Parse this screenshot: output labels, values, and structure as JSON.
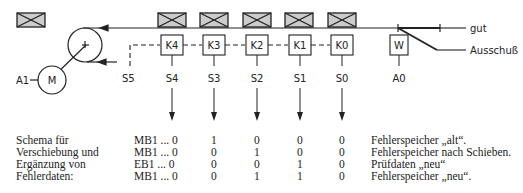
{
  "diagram": {
    "motor": {
      "label": "M",
      "output": "A1"
    },
    "registers": [
      {
        "id": "K4",
        "sensor": "S4"
      },
      {
        "id": "K3",
        "sensor": "S3"
      },
      {
        "id": "K2",
        "sensor": "S2"
      },
      {
        "id": "K1",
        "sensor": "S1"
      },
      {
        "id": "K0",
        "sensor": "S0"
      }
    ],
    "start_sensor": "S5",
    "switch": {
      "label": "W",
      "output": "A0"
    },
    "outputs": {
      "good": "gut",
      "reject": "Ausschuß"
    }
  },
  "table": {
    "caption_lines": [
      "Schema für",
      "Verschiebung und",
      "Ergänzung von",
      "Fehlerdaten:"
    ],
    "rows": [
      {
        "ref": "MB1 ... 0",
        "bits": [
          "1",
          "0",
          "0",
          "0"
        ],
        "note": "Fehlerspeicher „alt“."
      },
      {
        "ref": "MB1 ... 0",
        "bits": [
          "0",
          "1",
          "0",
          "0"
        ],
        "note": "Fehlerspeicher nach Schieben."
      },
      {
        "ref": "EB1 ... 0",
        "bits": [
          "0",
          "0",
          "1",
          "0"
        ],
        "note": "Prüfdaten „neu“"
      },
      {
        "ref": "MB1 ... 0",
        "bits": [
          "0",
          "1",
          "1",
          "0"
        ],
        "note": "Fehlerspeicher „neu“."
      }
    ]
  }
}
